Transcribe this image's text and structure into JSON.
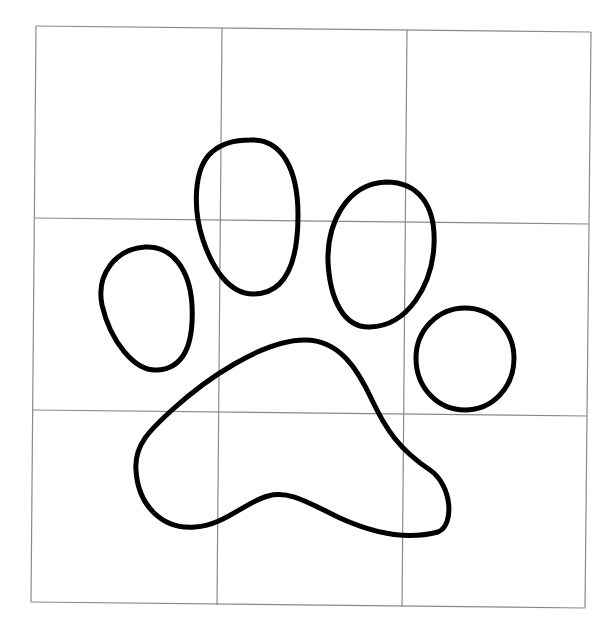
{
  "image": {
    "description": "Paw print outline drawn over a 3x3 grid",
    "width": 614,
    "height": 636,
    "background": "#ffffff"
  },
  "grid": {
    "rows": 3,
    "columns": 3,
    "line_color": "#8a8a8a",
    "lines": [
      {
        "name": "grid-border-top",
        "x1": 36,
        "y1": 26,
        "x2": 591,
        "y2": 32
      },
      {
        "name": "grid-border-bottom",
        "x1": 31,
        "y1": 602,
        "x2": 585,
        "y2": 608
      },
      {
        "name": "grid-border-left",
        "x1": 36,
        "y1": 26,
        "x2": 31,
        "y2": 602
      },
      {
        "name": "grid-border-right",
        "x1": 591,
        "y1": 32,
        "x2": 585,
        "y2": 608
      },
      {
        "name": "grid-line-horizontal-1",
        "x1": 34,
        "y1": 218,
        "x2": 589,
        "y2": 224
      },
      {
        "name": "grid-line-horizontal-2",
        "x1": 32,
        "y1": 410,
        "x2": 587,
        "y2": 416
      },
      {
        "name": "grid-line-vertical-1",
        "x1": 222,
        "y1": 28,
        "x2": 217,
        "y2": 605
      },
      {
        "name": "grid-line-vertical-2",
        "x1": 407,
        "y1": 30,
        "x2": 402,
        "y2": 607
      }
    ]
  },
  "paw": {
    "stroke_color": "#000000",
    "stroke_width": 5,
    "shapes": [
      {
        "name": "toe-pad-left",
        "d": "M 145 247 C 172 245 190 270 192 305 C 194 345 184 368 158 370 C 134 372 110 340 102 305 C 96 275 115 249 145 247 Z"
      },
      {
        "name": "toe-pad-inner-left",
        "d": "M 250 140 C 282 138 298 170 298 215 C 298 265 285 294 253 294 C 230 294 213 270 203 240 C 193 210 193 168 212 152 C 222 143 236 140 250 140 Z"
      },
      {
        "name": "toe-pad-inner-right",
        "d": "M 386 182 C 418 182 436 205 434 245 C 432 285 408 326 370 327 C 344 328 330 300 328 262 C 327 225 345 184 386 182 Z"
      },
      {
        "name": "toe-pad-right",
        "d": "M 465 308 C 492 308 514 330 514 358 C 514 388 492 410 465 410 C 438 410 416 388 416 358 C 416 330 438 308 465 308 Z"
      },
      {
        "name": "main-pad",
        "d": "M 305 340 C 340 340 358 370 372 400 C 386 430 400 450 430 470 C 452 485 455 525 438 532 C 408 540 375 534 340 518 C 310 504 290 490 268 496 C 245 502 225 525 195 527 C 162 530 138 505 136 470 C 134 445 150 430 172 410 C 205 380 262 340 305 340 Z"
      }
    ]
  }
}
